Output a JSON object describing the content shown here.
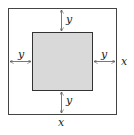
{
  "diagram": {
    "type": "geometry",
    "outer_square": {
      "side_label": "x",
      "fill": "#ffffff",
      "stroke": "#444444"
    },
    "inner_square": {
      "fill": "#d9d9d9",
      "stroke": "#333333"
    },
    "border_labels": {
      "top": "y",
      "bottom": "y",
      "left": "y",
      "right": "y"
    },
    "side_labels": {
      "right": "x",
      "bottom": "x"
    },
    "arrow_color": "#555555"
  }
}
